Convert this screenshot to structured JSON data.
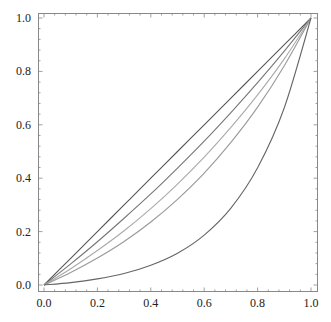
{
  "chart_data": {
    "type": "line",
    "title": "",
    "xlabel": "",
    "ylabel": "",
    "xlim": [
      0,
      1
    ],
    "ylim": [
      0,
      1
    ],
    "grid": false,
    "legend": null,
    "x_ticks": [
      "0.0",
      "0.2",
      "0.4",
      "0.6",
      "0.8",
      "1.0"
    ],
    "y_ticks": [
      "0.0",
      "0.2",
      "0.4",
      "0.6",
      "0.8",
      "1.0"
    ],
    "x": [
      0,
      0.1,
      0.2,
      0.3,
      0.4,
      0.5,
      0.6,
      0.7,
      0.8,
      0.9,
      1.0
    ],
    "series": [
      {
        "name": "curve-1",
        "color": "#555555",
        "values": [
          0,
          0.1,
          0.2,
          0.3,
          0.4,
          0.5,
          0.6,
          0.7,
          0.8,
          0.9,
          1.0
        ]
      },
      {
        "name": "curve-2",
        "color": "#777777",
        "values": [
          0,
          0.079,
          0.162,
          0.25,
          0.341,
          0.438,
          0.539,
          0.646,
          0.758,
          0.876,
          1.0
        ]
      },
      {
        "name": "curve-3",
        "color": "#aaaaaa",
        "values": [
          0,
          0.061,
          0.129,
          0.203,
          0.286,
          0.378,
          0.479,
          0.59,
          0.712,
          0.847,
          1.0
        ]
      },
      {
        "name": "curve-4",
        "color": "#999999",
        "values": [
          0,
          0.047,
          0.101,
          0.163,
          0.236,
          0.321,
          0.419,
          0.534,
          0.666,
          0.821,
          1.0
        ]
      },
      {
        "name": "curve-5",
        "color": "#666666",
        "values": [
          0,
          0.009,
          0.023,
          0.043,
          0.074,
          0.119,
          0.187,
          0.288,
          0.439,
          0.664,
          1.0
        ]
      }
    ]
  }
}
